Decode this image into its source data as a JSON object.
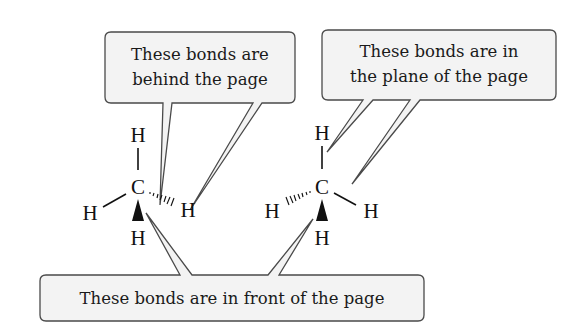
{
  "diagram": {
    "type": "stereochemistry-wedge-dash",
    "callouts": {
      "behind": {
        "label_line1": "These bonds are",
        "label_line2": "behind the page"
      },
      "plane": {
        "label_line1": "These bonds are in",
        "label_line2": "the plane of the page"
      },
      "front": {
        "label": "These bonds are in front of the page"
      }
    },
    "molecules": [
      {
        "id": "left",
        "center": "C",
        "atoms": {
          "top": "H",
          "left": "H",
          "right": "H",
          "bottom": "H"
        },
        "bonds": {
          "top": "plain",
          "left": "plain",
          "right": "hashed",
          "bottom": "wedge"
        }
      },
      {
        "id": "right",
        "center": "C",
        "atoms": {
          "top": "H",
          "left": "H",
          "right": "H",
          "bottom": "H"
        },
        "bonds": {
          "top": "plain",
          "left": "hashed",
          "right": "plain",
          "bottom": "wedge"
        }
      }
    ],
    "colors": {
      "box_fill": "#f3f3f3",
      "box_stroke": "#4a4a4a",
      "ink": "#111111"
    }
  }
}
